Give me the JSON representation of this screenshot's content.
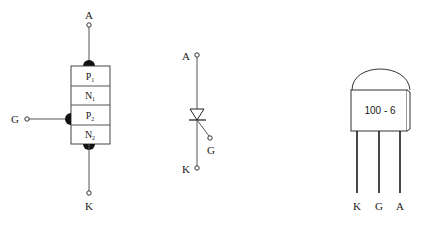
{
  "structure_diagram": {
    "terminals": {
      "anode": "A",
      "gate": "G",
      "cathode": "K"
    },
    "layers": [
      {
        "base": "P",
        "sub": "1"
      },
      {
        "base": "N",
        "sub": "1"
      },
      {
        "base": "P",
        "sub": "2"
      },
      {
        "base": "N",
        "sub": "2"
      }
    ]
  },
  "symbol_diagram": {
    "terminals": {
      "anode": "A",
      "gate": "G",
      "cathode": "K"
    }
  },
  "package_diagram": {
    "marking": "100 - 6",
    "pins": [
      "K",
      "G",
      "A"
    ]
  },
  "colors": {
    "line": "#555555",
    "fill_dark": "#111111",
    "background": "#ffffff"
  }
}
